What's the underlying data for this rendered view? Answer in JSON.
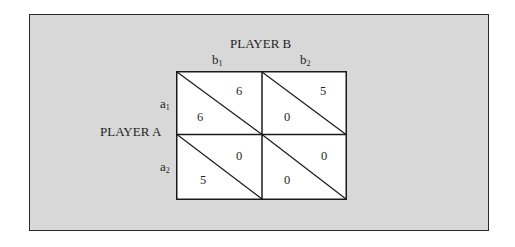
{
  "figure": {
    "type": "game-payoff-matrix",
    "column_player": {
      "label": "PLAYER B",
      "strategies": [
        {
          "base": "b",
          "sub": "1"
        },
        {
          "base": "b",
          "sub": "2"
        }
      ]
    },
    "row_player": {
      "label": "PLAYER A",
      "strategies": [
        {
          "base": "a",
          "sub": "1"
        },
        {
          "base": "a",
          "sub": "2"
        }
      ]
    },
    "cells": [
      {
        "row": "a1",
        "col": "b1",
        "payoff_A": "6",
        "payoff_B": "6"
      },
      {
        "row": "a1",
        "col": "b2",
        "payoff_A": "0",
        "payoff_B": "5"
      },
      {
        "row": "a2",
        "col": "b1",
        "payoff_A": "5",
        "payoff_B": "0"
      },
      {
        "row": "a2",
        "col": "b2",
        "payoff_A": "0",
        "payoff_B": "0"
      }
    ],
    "colors": {
      "background": "#d8d8d8",
      "cell": "#ffffff",
      "line": "#1a1a1a"
    }
  }
}
